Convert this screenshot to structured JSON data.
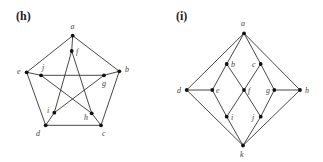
{
  "figure": {
    "panels": [
      {
        "id": "h",
        "label": "(h)",
        "label_pos": [
          16,
          20
        ],
        "nodes": [
          {
            "id": "a",
            "x": 72.7,
            "y": 35.7,
            "lx": 70.5,
            "ly": 29
          },
          {
            "id": "b",
            "x": 119.3,
            "y": 71.3,
            "lx": 125,
            "ly": 72
          },
          {
            "id": "c",
            "x": 101,
            "y": 125.3,
            "lx": 102,
            "ly": 136
          },
          {
            "id": "d",
            "x": 45.7,
            "y": 125.3,
            "lx": 36,
            "ly": 136
          },
          {
            "id": "e",
            "x": 26.7,
            "y": 72.3,
            "lx": 17,
            "ly": 74
          },
          {
            "id": "f",
            "x": 71.7,
            "y": 51,
            "lx": 76,
            "ly": 54
          },
          {
            "id": "g",
            "x": 104,
            "y": 75.3,
            "lx": 102,
            "ly": 86
          },
          {
            "id": "h",
            "x": 91.7,
            "y": 113.3,
            "lx": 84,
            "ly": 120
          },
          {
            "id": "i",
            "x": 54.3,
            "y": 112.7,
            "lx": 47,
            "ly": 113
          },
          {
            "id": "j",
            "x": 41,
            "y": 75.3,
            "lx": 42,
            "ly": 70
          }
        ],
        "edges": [
          [
            "a",
            "b"
          ],
          [
            "b",
            "c"
          ],
          [
            "c",
            "d"
          ],
          [
            "d",
            "e"
          ],
          [
            "e",
            "a"
          ],
          [
            "a",
            "f"
          ],
          [
            "b",
            "g"
          ],
          [
            "c",
            "h"
          ],
          [
            "d",
            "i"
          ],
          [
            "e",
            "j"
          ],
          [
            "f",
            "h"
          ],
          [
            "h",
            "j"
          ],
          [
            "j",
            "g"
          ],
          [
            "g",
            "i"
          ],
          [
            "i",
            "f"
          ]
        ]
      },
      {
        "id": "i",
        "label": "(i)",
        "label_pos": [
          176,
          20
        ],
        "nodes": [
          {
            "id": "a",
            "x": 244,
            "y": 33.3,
            "lx": 241,
            "ly": 26
          },
          {
            "id": "b",
            "x": 226.7,
            "y": 64,
            "lx": 231,
            "ly": 67
          },
          {
            "id": "c",
            "x": 260.7,
            "y": 64,
            "lx": 252,
            "ly": 67
          },
          {
            "id": "d",
            "x": 186.7,
            "y": 90,
            "lx": 177,
            "ly": 93
          },
          {
            "id": "e",
            "x": 212.3,
            "y": 90,
            "lx": 216,
            "ly": 93
          },
          {
            "id": "f",
            "x": 244,
            "y": 90,
            "lx": 248,
            "ly": 93
          },
          {
            "id": "g",
            "x": 274.3,
            "y": 90,
            "lx": 266,
            "ly": 93
          },
          {
            "id": "h",
            "x": 300,
            "y": 90,
            "lx": 305,
            "ly": 93
          },
          {
            "id": "i",
            "x": 226.7,
            "y": 116.7,
            "lx": 231,
            "ly": 120
          },
          {
            "id": "j",
            "x": 260.7,
            "y": 116.7,
            "lx": 252,
            "ly": 120
          },
          {
            "id": "k",
            "x": 243,
            "y": 145.5,
            "lx": 240,
            "ly": 157
          }
        ],
        "edges": [
          [
            "a",
            "d"
          ],
          [
            "a",
            "b"
          ],
          [
            "a",
            "c"
          ],
          [
            "a",
            "h"
          ],
          [
            "d",
            "e"
          ],
          [
            "d",
            "k"
          ],
          [
            "h",
            "g"
          ],
          [
            "h",
            "k"
          ],
          [
            "b",
            "e"
          ],
          [
            "b",
            "f"
          ],
          [
            "c",
            "f"
          ],
          [
            "c",
            "g"
          ],
          [
            "e",
            "i"
          ],
          [
            "f",
            "i"
          ],
          [
            "f",
            "j"
          ],
          [
            "g",
            "j"
          ],
          [
            "i",
            "k"
          ],
          [
            "j",
            "k"
          ]
        ]
      }
    ]
  }
}
